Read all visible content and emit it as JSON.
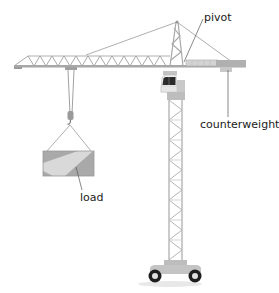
{
  "diagram": {
    "labels": {
      "pivot": "pivot",
      "counterweight": "counterweight",
      "load": "load"
    },
    "colors": {
      "structure": "#b8b8b8",
      "structure_dark": "#8e8e8e",
      "counterweight": "#a9a9a9",
      "load_dark": "#a8a8a8",
      "load_light": "#d6d6d6",
      "cab_window": "#2b2b2b",
      "wheel": "#1e1e1e",
      "leader_line": "#555555",
      "text": "#1a1a1a"
    }
  }
}
